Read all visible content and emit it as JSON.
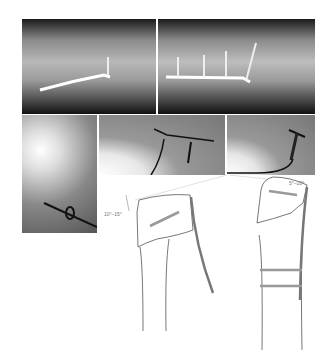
{
  "figure": {
    "panels": [
      {
        "id": "xray-lateral-1",
        "description": "Lateral radiograph with bent plate fixation"
      },
      {
        "id": "xray-ap-1",
        "description": "Radiograph with plate and three screws"
      },
      {
        "id": "xray-oblique",
        "description": "Radiograph with K-wire and cerclage"
      },
      {
        "id": "xray-lateral-2",
        "description": "Radiograph with wire"
      },
      {
        "id": "xray-lateral-3",
        "description": "Radiograph with plate and screw"
      }
    ],
    "diagram": {
      "angle_left": "10°–15°",
      "angle_right": "5°–10°"
    }
  }
}
